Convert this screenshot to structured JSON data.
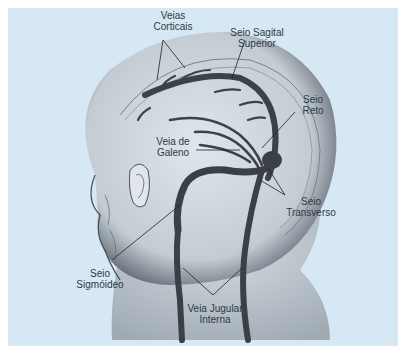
{
  "diagram": {
    "background_color": "#d6e8f3",
    "labels": {
      "veias_corticais": "Veias\nCorticais",
      "seio_sagital_superior": "Seio Sagital\nSuperior",
      "seio_reto": "Seio\nReto",
      "veia_de_galeno": "Veia de\nGaleno",
      "seio_transverso": "Seio\nTransverso",
      "seio_sigmoideo": "Seio\nSigmóideo",
      "veia_jugular_interna": "Veia Jugular\nInterna"
    }
  }
}
